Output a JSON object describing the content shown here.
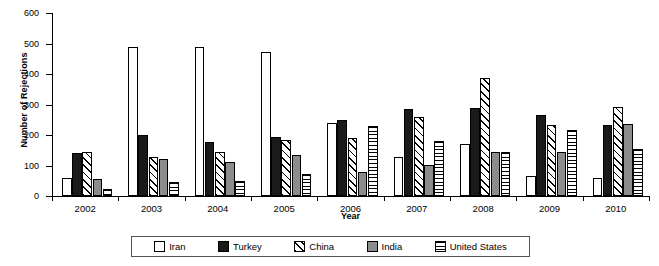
{
  "chart_data": {
    "type": "bar",
    "title": "",
    "xlabel": "Year",
    "ylabel": "Number of Rejections",
    "categories": [
      "2002",
      "2003",
      "2004",
      "2005",
      "2006",
      "2007",
      "2008",
      "2009",
      "2010"
    ],
    "ylim": [
      0,
      600
    ],
    "yticks": [
      0,
      100,
      200,
      300,
      400,
      500,
      600
    ],
    "grid": false,
    "legend_position": "bottom",
    "series": [
      {
        "name": "Iran",
        "pattern": "white-empty",
        "color": "#ffffff",
        "values": [
          60,
          490,
          490,
          472,
          240,
          128,
          170,
          65,
          60
        ]
      },
      {
        "name": "Turkey",
        "pattern": "solid-black",
        "color": "#1a1a1a",
        "values": [
          140,
          200,
          178,
          195,
          248,
          285,
          290,
          265,
          232
        ]
      },
      {
        "name": "China",
        "pattern": "diagonal-hatch",
        "color": "#ffffff",
        "values": [
          145,
          128,
          145,
          185,
          190,
          260,
          388,
          232,
          292
        ]
      },
      {
        "name": "India",
        "pattern": "solid-gray",
        "color": "#8c8c8c",
        "values": [
          57,
          120,
          110,
          133,
          80,
          103,
          145,
          145,
          237
        ]
      },
      {
        "name": "United States",
        "pattern": "horizontal-lines",
        "color": "#ffffff",
        "values": [
          22,
          45,
          48,
          72,
          228,
          180,
          143,
          217,
          153
        ]
      }
    ]
  },
  "legend": {
    "items": [
      {
        "label": "Iran"
      },
      {
        "label": "Turkey"
      },
      {
        "label": "China"
      },
      {
        "label": "India"
      },
      {
        "label": "United States"
      }
    ]
  }
}
